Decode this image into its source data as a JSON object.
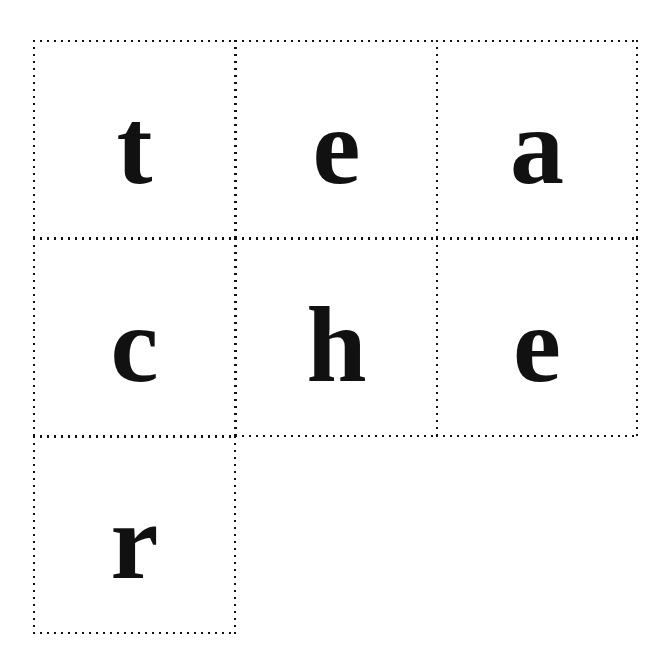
{
  "worksheet": {
    "word": "teacher",
    "letter_count": 7,
    "grid": {
      "columns": 3,
      "rows": 3,
      "cell_border_style": "dotted",
      "border_color": "#111111",
      "background_color": "#ffffff",
      "text_color": "#111111"
    },
    "cells": [
      {
        "id": "cell-r1c1",
        "row": 1,
        "col": 1,
        "letter": "t",
        "filled": true
      },
      {
        "id": "cell-r1c2",
        "row": 1,
        "col": 2,
        "letter": "e",
        "filled": true
      },
      {
        "id": "cell-r1c3",
        "row": 1,
        "col": 3,
        "letter": "a",
        "filled": true
      },
      {
        "id": "cell-r2c1",
        "row": 2,
        "col": 1,
        "letter": "c",
        "filled": true
      },
      {
        "id": "cell-r2c2",
        "row": 2,
        "col": 2,
        "letter": "h",
        "filled": true
      },
      {
        "id": "cell-r2c3",
        "row": 2,
        "col": 3,
        "letter": "e",
        "filled": true
      },
      {
        "id": "cell-r3c1",
        "row": 3,
        "col": 1,
        "letter": "r",
        "filled": true
      }
    ]
  }
}
